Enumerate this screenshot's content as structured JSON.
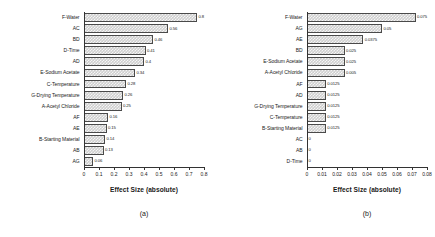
{
  "figure": {
    "panels": [
      {
        "caption": "(a)",
        "axis_title": "Effect Size (absolute)"
      },
      {
        "caption": "(b)",
        "axis_title": "Effect Size (absolute)"
      }
    ]
  },
  "chart_data": [
    {
      "type": "bar",
      "orientation": "horizontal",
      "title": "",
      "caption": "(a)",
      "xlabel": "Effect Size (absolute)",
      "ylabel": "",
      "xlim": [
        0,
        0.8
      ],
      "grid": false,
      "legend": null,
      "categories": [
        "F-Water",
        "AC",
        "BD",
        "D-Time",
        "AD",
        "E-Sodium Acetate",
        "C-Temperature",
        "G-Drying Temperature",
        "A-Acetyl Chloride",
        "AF",
        "AE",
        "B-Starting Material",
        "AB",
        "AG"
      ],
      "values": [
        0.8,
        0.56,
        0.46,
        0.41,
        0.4,
        0.34,
        0.28,
        0.26,
        0.25,
        0.16,
        0.15,
        0.14,
        0.13,
        0.06
      ],
      "value_labels": [
        "0.8",
        "0.56",
        "0.46",
        "0.41",
        "0.4",
        "0.34",
        "0.28",
        "0.26",
        "0.25",
        "0.16",
        "0.15",
        "0.14",
        "0.13",
        "0.06"
      ],
      "xticks": [
        0,
        0.1,
        0.2,
        0.3,
        0.4,
        0.5,
        0.6,
        0.7,
        0.8
      ],
      "xtick_labels": [
        "0",
        "0.1",
        "0.2",
        "0.3",
        "0.4",
        "0.5",
        "0.6",
        "0.7",
        "0.8"
      ]
    },
    {
      "type": "bar",
      "orientation": "horizontal",
      "title": "",
      "caption": "(b)",
      "xlabel": "Effect Size (absolute)",
      "ylabel": "",
      "xlim": [
        0,
        0.08
      ],
      "grid": false,
      "legend": null,
      "categories": [
        "F-Water",
        "AG",
        "AE",
        "BD",
        "E-Sodium Acetate",
        "A-Acetyl Chloride",
        "AF",
        "AD",
        "G-Drying Temperature",
        "C-Temperature",
        "B-Starting Material",
        "AC",
        "AB",
        "D-Time"
      ],
      "values": [
        0.075,
        0.05,
        0.0375,
        0.025,
        0.025,
        0.025,
        0.0125,
        0.0125,
        0.0125,
        0.0125,
        0.0125,
        0,
        0,
        0
      ],
      "value_labels": [
        "0.075",
        "0.05",
        "0.0375",
        "0.025",
        "0.025",
        "0.005",
        "0.0125",
        "0.0125",
        "0.0125",
        "0.0125",
        "0.0125",
        "0",
        "0",
        "0"
      ],
      "xticks": [
        0,
        0.01,
        0.02,
        0.03,
        0.04,
        0.05,
        0.06,
        0.07,
        0.08
      ],
      "xtick_labels": [
        "0",
        "0.01",
        "0.02",
        "0.03",
        "0.04",
        "0.05",
        "0.06",
        "0.07",
        "0.08"
      ]
    }
  ]
}
